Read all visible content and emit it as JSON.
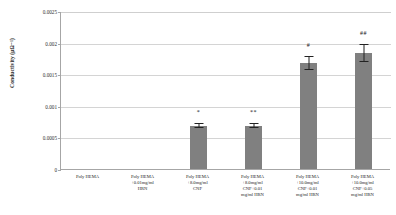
{
  "chart_data": {
    "type": "bar",
    "title": "",
    "xlabel": "",
    "ylabel": "Conductivity (µΩ⁻¹)",
    "ylim": [
      0,
      0.0025
    ],
    "ytick_labels": [
      "0.0025",
      "0.002",
      "0.0015",
      "0.001",
      "0.0005",
      "0"
    ],
    "ytick_values": [
      0.0025,
      0.002,
      0.0015,
      0.001,
      0.0005,
      0
    ],
    "grid": true,
    "legend": "none",
    "categories": [
      "Poly HEMA",
      "Poly HEMA\n+0.01mg/ml\nHRN",
      "Poly HEMA\n+8.0mg/ml\nCNF",
      "Poly HEMA\n+8.0mg/ml\nCNF+0.01\nmg/ml HRN",
      "Poly HEMA\n+10.0mg/ml\nCNF+0.01\nmg/ml HRN",
      "Poly HEMA\n+10.0mg/ml\nCNF+0.05\nmg/ml HRN"
    ],
    "values": [
      0,
      0,
      0.00068,
      0.00068,
      0.00167,
      0.00183
    ],
    "errors": [
      0,
      0,
      3e-05,
      3e-05,
      0.00011,
      0.00013
    ],
    "annotations": [
      "",
      "",
      "*",
      "**",
      "#",
      "##"
    ],
    "bar_color": "#808080",
    "grid_color": "#d4d4d4",
    "axis_color": "#a6a6a6"
  }
}
